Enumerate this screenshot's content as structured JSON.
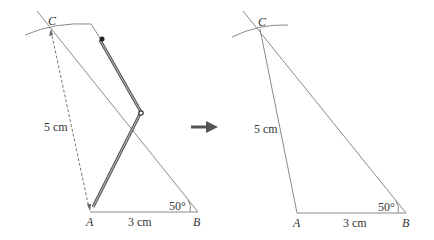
{
  "diagram": {
    "left_panel": {
      "title": "construction-step",
      "points": {
        "A": "A",
        "B": "B",
        "C": "C"
      },
      "labels": {
        "ac_length": "5 cm",
        "ab_length": "3 cm",
        "angle_b": "50°"
      },
      "tool": "compass"
    },
    "right_panel": {
      "title": "completed-triangle",
      "points": {
        "A": "A",
        "B": "B",
        "C": "C"
      },
      "labels": {
        "ac_length": "5 cm",
        "ab_length": "3 cm",
        "angle_b": "50°"
      }
    },
    "arrow": "right-arrow",
    "colors": {
      "line": "#8a8a8a",
      "compass": "#555555",
      "arrow": "#555555",
      "text": "#333333"
    }
  }
}
